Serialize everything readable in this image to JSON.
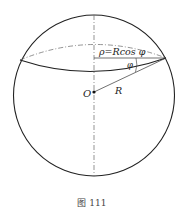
{
  "figure": {
    "caption": "图 111",
    "labels": {
      "rho_formula": "ρ=Rcos φ",
      "phi": "φ",
      "radius": "R",
      "center": "O"
    },
    "colors": {
      "stroke": "#222222",
      "dashed": "#555555",
      "background": "#ffffff"
    }
  }
}
